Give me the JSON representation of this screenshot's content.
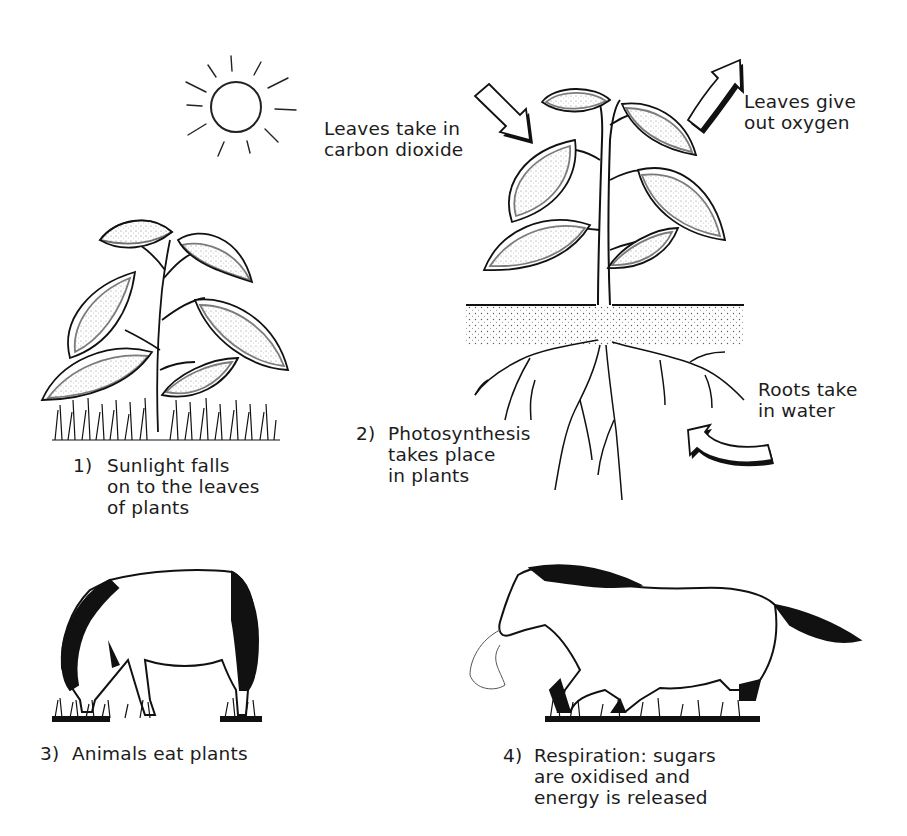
{
  "annotations": {
    "co2": {
      "lines": [
        "Leaves take in",
        "carbon dioxide"
      ]
    },
    "o2": {
      "lines": [
        "Leaves give",
        "out oxygen"
      ]
    },
    "water": {
      "lines": [
        "Roots take",
        "in water"
      ]
    }
  },
  "steps": [
    {
      "number": "1)",
      "lines": [
        "Sunlight falls",
        "on to the leaves",
        "of plants"
      ]
    },
    {
      "number": "2)",
      "lines": [
        "Photosynthesis",
        "takes place",
        "in plants"
      ]
    },
    {
      "number": "3)",
      "lines": [
        "Animals eat plants"
      ]
    },
    {
      "number": "4)",
      "lines": [
        "Respiration: sugars",
        "are oxidised and",
        "energy is released"
      ]
    }
  ],
  "icons": [
    "sun-icon",
    "small-plant-illustration",
    "plant-with-roots-illustration",
    "arrow-in-icon",
    "arrow-out-icon",
    "curved-arrow-icon",
    "grazing-horse-illustration",
    "running-horse-illustration"
  ],
  "colors": {
    "ink": "#1a1a1a",
    "background": "#ffffff"
  }
}
